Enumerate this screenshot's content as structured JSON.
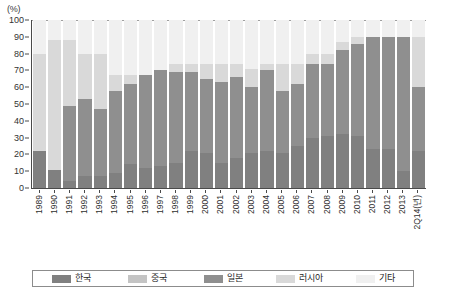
{
  "chart_data": {
    "type": "bar",
    "stacked": true,
    "stack_mode": "percent",
    "title": "",
    "subtitle": "",
    "xlabel": "(년)",
    "ylabel": "(%)",
    "ylim": [
      0,
      100
    ],
    "yticks": [
      0,
      10,
      20,
      30,
      40,
      50,
      60,
      70,
      80,
      90,
      100
    ],
    "ytick_labels": [
      "0",
      "10",
      "20",
      "30",
      "40",
      "50",
      "60",
      "70",
      "80",
      "90",
      "100"
    ],
    "grid": true,
    "legend_position": "bottom",
    "categories": [
      "1989",
      "1990",
      "1991",
      "1992",
      "1993",
      "1994",
      "1995",
      "1996",
      "1997",
      "1998",
      "1999",
      "2000",
      "2001",
      "2002",
      "2003",
      "2004",
      "2005",
      "2006",
      "2007",
      "2008",
      "2009",
      "2010",
      "2011",
      "2012",
      "2013",
      "2Q14"
    ],
    "series": [
      {
        "name": "한국",
        "color": "#808080",
        "values": [
          22,
          11,
          4,
          7,
          7,
          9,
          14,
          12,
          13,
          15,
          22,
          21,
          15,
          18,
          21,
          22,
          21,
          25,
          30,
          31,
          32,
          31,
          23,
          23,
          10,
          22
        ]
      },
      {
        "name": "중국",
        "color": "#c4c4c4",
        "values": [
          0,
          0,
          0,
          0,
          0,
          0,
          0,
          0,
          0,
          0,
          0,
          0,
          0,
          0,
          0,
          0,
          0,
          0,
          0,
          0,
          0,
          0,
          0,
          0,
          0,
          0
        ]
      },
      {
        "name": "일본",
        "color": "#8f8f8f",
        "values": [
          0,
          0,
          45,
          46,
          40,
          49,
          48,
          55,
          57,
          54,
          47,
          44,
          48,
          48,
          39,
          48,
          37,
          37,
          44,
          43,
          50,
          55,
          67,
          67,
          80,
          38
        ]
      },
      {
        "name": "러시아",
        "color": "#d9d9d9",
        "values": [
          58,
          77,
          39,
          27,
          33,
          9,
          5,
          0,
          0,
          5,
          5,
          9,
          11,
          8,
          11,
          4,
          16,
          12,
          6,
          6,
          5,
          4,
          0,
          0,
          0,
          30
        ]
      },
      {
        "name": "기타",
        "color": "#f0f0f0",
        "values": [
          20,
          12,
          12,
          20,
          20,
          33,
          33,
          33,
          30,
          26,
          26,
          26,
          26,
          26,
          29,
          26,
          26,
          26,
          20,
          20,
          13,
          10,
          10,
          10,
          10,
          10
        ]
      }
    ]
  },
  "axis": {
    "unit_label": "(%)",
    "x_unit_suffix": "(년)"
  },
  "legend": {
    "items": [
      {
        "label": "한국",
        "color": "#808080"
      },
      {
        "label": "중국",
        "color": "#c4c4c4"
      },
      {
        "label": "일본",
        "color": "#8f8f8f"
      },
      {
        "label": "러시아",
        "color": "#d9d9d9"
      },
      {
        "label": "기타",
        "color": "#f0f0f0"
      }
    ]
  }
}
